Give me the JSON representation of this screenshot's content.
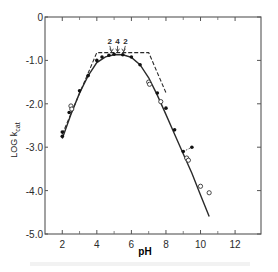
{
  "chart_data": {
    "type": "scatter",
    "title": "",
    "xlabel": "pH",
    "ylabel": "LOG k_cat",
    "ylabel_main": "LOG k",
    "ylabel_sub": "cat",
    "xlim": [
      1,
      13.5
    ],
    "ylim": [
      -5.0,
      0
    ],
    "x_ticks": [
      2,
      4,
      6,
      8,
      10,
      12
    ],
    "x_tick_labels": [
      "2",
      "4",
      "6",
      "8",
      "10",
      "12"
    ],
    "x_minor_ticks": [
      3,
      5,
      7,
      9,
      11
    ],
    "y_ticks": [
      0,
      -1.0,
      -2.0,
      -3.0,
      -4.0,
      -5.0
    ],
    "y_tick_labels": [
      "0",
      "-1.0",
      "-2.0",
      "-3.0",
      "-4.0",
      "-5.0"
    ],
    "grid": false,
    "legend": null,
    "series": [
      {
        "name": "filled points",
        "marker": "filled-circle",
        "points": [
          [
            2.0,
            -2.75
          ],
          [
            2.0,
            -2.65
          ],
          [
            2.4,
            -2.2
          ],
          [
            3.0,
            -1.7
          ],
          [
            3.5,
            -1.35
          ],
          [
            4.0,
            -1.0
          ],
          [
            4.3,
            -0.92
          ],
          [
            4.7,
            -0.88
          ],
          [
            5.0,
            -0.86
          ],
          [
            5.5,
            -0.87
          ],
          [
            6.0,
            -0.92
          ],
          [
            6.5,
            -1.1
          ],
          [
            7.5,
            -1.75
          ],
          [
            8.0,
            -2.1
          ],
          [
            8.5,
            -2.6
          ],
          [
            9.0,
            -3.1
          ],
          [
            9.5,
            -3.0
          ]
        ]
      },
      {
        "name": "open points",
        "marker": "open-circle",
        "points": [
          [
            2.5,
            -2.05
          ],
          [
            2.55,
            -2.12
          ],
          [
            7.0,
            -1.5
          ],
          [
            7.05,
            -1.55
          ],
          [
            7.7,
            -1.95
          ],
          [
            9.2,
            -3.25
          ],
          [
            9.3,
            -3.3
          ],
          [
            10.0,
            -3.9
          ],
          [
            10.5,
            -4.05
          ]
        ]
      },
      {
        "name": "fitted curve",
        "style": "solid",
        "points": [
          [
            2.0,
            -2.8
          ],
          [
            2.5,
            -2.25
          ],
          [
            3.0,
            -1.75
          ],
          [
            3.5,
            -1.35
          ],
          [
            4.0,
            -1.05
          ],
          [
            4.5,
            -0.92
          ],
          [
            5.0,
            -0.87
          ],
          [
            5.5,
            -0.87
          ],
          [
            6.0,
            -0.93
          ],
          [
            6.5,
            -1.1
          ],
          [
            7.0,
            -1.4
          ],
          [
            7.5,
            -1.8
          ],
          [
            8.0,
            -2.25
          ],
          [
            8.5,
            -2.7
          ],
          [
            9.0,
            -3.15
          ],
          [
            9.5,
            -3.6
          ],
          [
            10.0,
            -4.1
          ],
          [
            10.5,
            -4.6
          ]
        ]
      },
      {
        "name": "limiting slopes",
        "style": "dashed",
        "points": [
          [
            2.0,
            -2.7
          ],
          [
            4.0,
            -0.82
          ],
          [
            7.0,
            -0.82
          ],
          [
            8.0,
            -1.75
          ]
        ]
      }
    ],
    "annotations": [
      {
        "text": "2",
        "x": 4.75,
        "y": -0.62,
        "arrow_to": [
          4.85,
          -0.8
        ]
      },
      {
        "text": "4",
        "x": 5.2,
        "y": -0.62,
        "arrow_to": [
          5.2,
          -0.8
        ]
      },
      {
        "text": "2",
        "x": 5.65,
        "y": -0.62,
        "arrow_to": [
          5.55,
          -0.8
        ]
      }
    ]
  }
}
